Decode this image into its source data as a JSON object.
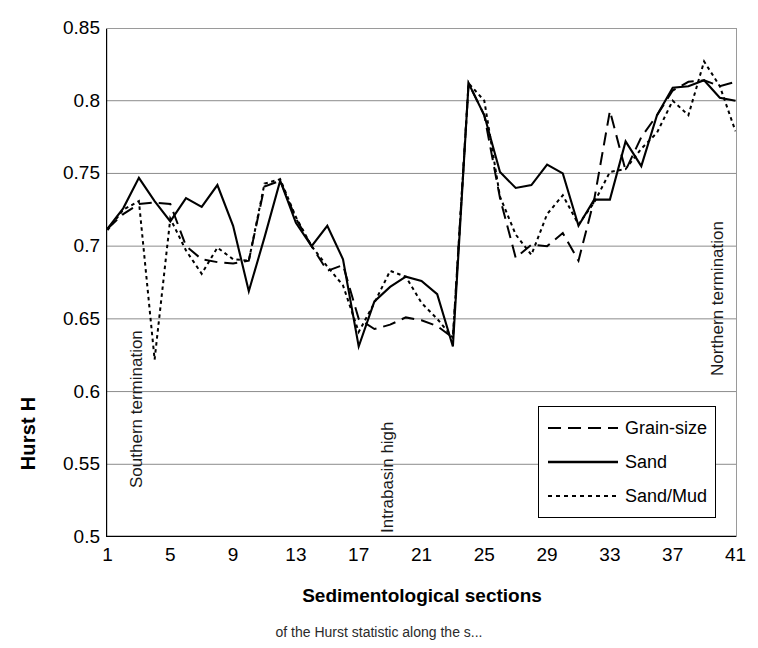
{
  "chart_data": {
    "type": "line",
    "title": "",
    "xlabel": "Sedimentological sections",
    "ylabel": "Hurst H",
    "xlim": [
      1,
      41
    ],
    "ylim": [
      0.5,
      0.85
    ],
    "ytick_labels": [
      "0.85",
      "0.8",
      "0.75",
      "0.7",
      "0.65",
      "0.6",
      "0.55",
      "0.5"
    ],
    "ytick_values": [
      0.85,
      0.8,
      0.75,
      0.7,
      0.65,
      0.6,
      0.55,
      0.5
    ],
    "xtick_labels": [
      "1",
      "5",
      "9",
      "13",
      "17",
      "21",
      "25",
      "29",
      "33",
      "37",
      "41"
    ],
    "xtick_values": [
      1,
      5,
      9,
      13,
      17,
      21,
      25,
      29,
      33,
      37,
      41
    ],
    "minor_xticks_every": 1,
    "grid": "horizontal",
    "legend_position": "lower-right",
    "x": [
      1,
      2,
      3,
      4,
      5,
      6,
      7,
      8,
      9,
      10,
      11,
      12,
      13,
      14,
      15,
      16,
      17,
      18,
      19,
      20,
      21,
      22,
      23,
      24,
      25,
      26,
      27,
      28,
      29,
      30,
      31,
      32,
      33,
      34,
      35,
      36,
      37,
      38,
      39,
      40,
      41
    ],
    "series": [
      {
        "name": "Grain-size",
        "style": "dashed",
        "values": [
          0.712,
          0.722,
          0.729,
          0.73,
          0.729,
          0.7,
          0.691,
          0.689,
          0.688,
          0.69,
          0.741,
          0.745,
          0.719,
          0.7,
          0.683,
          0.687,
          0.65,
          0.643,
          0.646,
          0.651,
          0.649,
          0.645,
          0.637,
          0.812,
          0.79,
          0.733,
          0.692,
          0.701,
          0.7,
          0.709,
          0.69,
          0.732,
          0.793,
          0.752,
          0.775,
          0.79,
          0.807,
          0.813,
          0.814,
          0.81,
          0.813
        ]
      },
      {
        "name": "Sand",
        "style": "solid",
        "values": [
          0.712,
          0.726,
          0.747,
          0.731,
          0.717,
          0.733,
          0.727,
          0.742,
          0.714,
          0.669,
          0.706,
          0.745,
          0.716,
          0.7,
          0.714,
          0.691,
          0.631,
          0.662,
          0.672,
          0.679,
          0.676,
          0.667,
          0.631,
          0.812,
          0.79,
          0.751,
          0.74,
          0.742,
          0.756,
          0.75,
          0.714,
          0.732,
          0.732,
          0.772,
          0.755,
          0.79,
          0.809,
          0.81,
          0.814,
          0.802,
          0.8
        ]
      },
      {
        "name": "Sand/Mud",
        "style": "dotted",
        "values": [
          0.711,
          0.725,
          0.731,
          0.622,
          0.719,
          0.697,
          0.681,
          0.699,
          0.691,
          0.69,
          0.743,
          0.746,
          0.72,
          0.7,
          0.686,
          0.673,
          0.641,
          0.661,
          0.683,
          0.679,
          0.661,
          0.65,
          0.637,
          0.812,
          0.8,
          0.734,
          0.708,
          0.694,
          0.722,
          0.735,
          0.715,
          0.73,
          0.751,
          0.753,
          0.767,
          0.778,
          0.8,
          0.79,
          0.827,
          0.81,
          0.779
        ]
      }
    ],
    "annotations": [
      {
        "text": "Southern termination",
        "x_section": 2,
        "note": "vertical text near left edge"
      },
      {
        "text": "Intrabasin high",
        "x_section": 18,
        "note": "vertical text near middle"
      },
      {
        "text": "Northern termination",
        "x_section": 39,
        "note": "vertical text near right edge"
      }
    ]
  },
  "legend": {
    "items": [
      {
        "label": "Grain-size",
        "style": "dashed"
      },
      {
        "label": "Sand",
        "style": "solid"
      },
      {
        "label": "Sand/Mud",
        "style": "dotted"
      }
    ]
  },
  "caption": "of the Hurst statistic along the s..."
}
